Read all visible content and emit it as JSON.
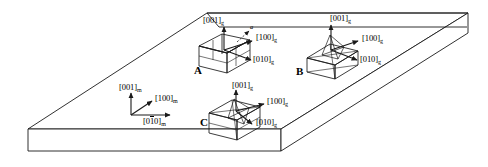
{
  "figure": {
    "colors": {
      "line": "#1a1a1a",
      "background": "#ffffff",
      "slab_top": "#ffffff"
    }
  },
  "matrix_axes": {
    "name": "matrix-reference-frame",
    "subscript": "m",
    "axes": [
      {
        "id": "axis-001-m",
        "prefix": "[001]",
        "sub": "m",
        "overbar_index": -1
      },
      {
        "id": "axis-100-m",
        "prefix": "[100]",
        "sub": "m",
        "overbar_index": -1
      },
      {
        "id": "axis-010-m",
        "pre": "[0",
        "bar": "1",
        "post": "0]",
        "sub": "m",
        "overbar_index": 1
      }
    ]
  },
  "variants": [
    {
      "id": "A",
      "label": "A",
      "axes": {
        "vertical": {
          "text": "[001]",
          "sub": "g"
        },
        "right": {
          "text": "[100]",
          "sub": "g"
        },
        "lower": {
          "text": "[010]",
          "sub": "g"
        }
      },
      "annotation": {
        "text": "a",
        "kind": "dashed-vector"
      }
    },
    {
      "id": "B",
      "label": "B",
      "axes": {
        "vertical": {
          "text": "[001]",
          "sub": "g"
        },
        "right": {
          "text": "[100]",
          "sub": "g"
        },
        "lower": {
          "text": "[010]",
          "sub": "g"
        }
      }
    },
    {
      "id": "C",
      "label": "C",
      "axes": {
        "vertical": {
          "text": "[001]",
          "sub": "g"
        },
        "right": {
          "text": "[100]",
          "sub": "g"
        },
        "lower": {
          "text": "[010]",
          "sub": "g"
        }
      }
    }
  ]
}
